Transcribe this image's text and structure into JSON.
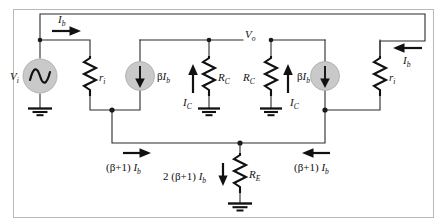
{
  "figure": {
    "type": "circuit-diagram",
    "width": 437,
    "height": 223,
    "background": "#ffffff",
    "frame_color": "#b8b8b8",
    "wire_color": "#2b2b2b",
    "source_fill": "#c9c9c9"
  },
  "labels": {
    "vi": "V",
    "vi_sub": "i",
    "vo": "V",
    "vo_sub": "o",
    "ri_left": "r",
    "ri_left_sub": "i",
    "ri_right": "r",
    "ri_right_sub": "i",
    "rc_left": "R",
    "rc_left_sub": "C",
    "rc_right": "R",
    "rc_right_sub": "C",
    "re": "R",
    "re_sub": "E",
    "ib_top_left": "I",
    "ib_top_left_sub": "b",
    "ib_top_right": "I",
    "ib_top_right_sub": "b",
    "ic_left": "I",
    "ic_left_sub": "C",
    "ic_right": "I",
    "ic_right_sub": "C",
    "beta_ib_left_greek": "β",
    "beta_ib_left": "I",
    "beta_ib_left_sub": "b",
    "beta_ib_right_greek": "β",
    "beta_ib_right": "I",
    "beta_ib_right_sub": "b",
    "emitter_left_open": "(",
    "emitter_left_beta": "β",
    "emitter_left_plus1": "+1)",
    "emitter_left_i": "I",
    "emitter_left_sub": "b",
    "emitter_right_open": "(",
    "emitter_right_beta": "β",
    "emitter_right_plus1": "+1)",
    "emitter_right_i": "I",
    "emitter_right_sub": "b",
    "re_current_coeff": "2 (",
    "re_current_beta": "β",
    "re_current_plus1": "+1)",
    "re_current_i": "I",
    "re_current_sub": "b"
  },
  "components": {
    "voltage_source": "ac-sine-source",
    "current_source_left": "dependent-current-source",
    "current_source_right": "dependent-current-source",
    "resistors": [
      "ri-left",
      "rc-left",
      "rc-right",
      "ri-right",
      "re"
    ],
    "grounds": [
      "ground-source",
      "ground-rc-left",
      "ground-rc-right",
      "ground-re"
    ]
  }
}
